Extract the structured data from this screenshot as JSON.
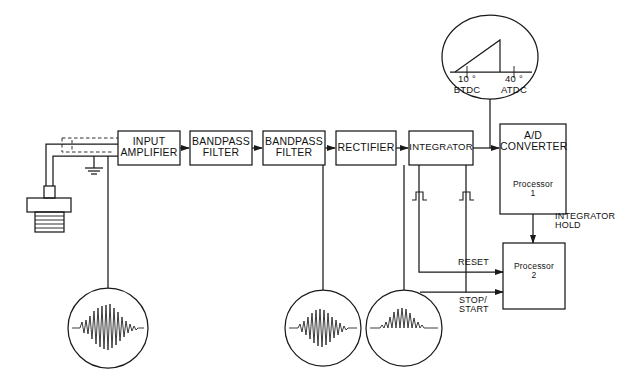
{
  "diagram": {
    "line_color": "#1a1a1a",
    "background": "#ffffff"
  },
  "blocks": [
    {
      "id": "input-amplifier",
      "label": "INPUT\nAMPLIFIER",
      "x": 118,
      "y": 131,
      "w": 62,
      "h": 34
    },
    {
      "id": "bandpass-filter-1",
      "label": "BANDPASS\nFILTER",
      "x": 190,
      "y": 131,
      "w": 62,
      "h": 34
    },
    {
      "id": "bandpass-filter-2",
      "label": "BANDPASS\nFILTER",
      "x": 263,
      "y": 131,
      "w": 62,
      "h": 34
    },
    {
      "id": "rectifier",
      "label": "RECTIFIER",
      "x": 336,
      "y": 131,
      "w": 60,
      "h": 34
    },
    {
      "id": "integrator",
      "label": "INTEGRATOR",
      "x": 409,
      "y": 131,
      "w": 64,
      "h": 34
    }
  ],
  "ad_converter": {
    "id": "ad-converter",
    "label": "A/D\nCONVERTER",
    "processor_label": "Processor\n1",
    "x": 500,
    "y": 124,
    "w": 66,
    "h": 90
  },
  "processor_2": {
    "id": "processor-2",
    "label": "Processor\n2",
    "x": 503,
    "y": 243,
    "w": 62,
    "h": 66
  },
  "signal_labels": [
    {
      "id": "integrator-hold",
      "text": "INTEGRATOR\nHOLD",
      "x": 560,
      "y": 212
    },
    {
      "id": "reset",
      "text": "RESET",
      "x": 478,
      "y": 262
    },
    {
      "id": "stop-start",
      "text": "STOP/\nSTART",
      "x": 479,
      "y": 299
    }
  ],
  "timing_inset": {
    "id": "timing-window",
    "left_angle": "10 °",
    "left_ref": "BTDC",
    "right_angle": "40 °",
    "right_ref": "ATDC",
    "cx": 490,
    "cy": 57,
    "rx": 48,
    "ry": 42
  },
  "waveform_circles": [
    {
      "id": "raw-knock-signal",
      "cx": 108,
      "cy": 328,
      "r": 40
    },
    {
      "id": "filtered-knock-signal",
      "cx": 323,
      "cy": 328,
      "r": 38
    },
    {
      "id": "rectified-knock-signal",
      "cx": 404,
      "cy": 328,
      "r": 38
    }
  ],
  "pulse_markers": [
    {
      "id": "reset-pulse",
      "x": 419,
      "y": 196
    },
    {
      "id": "hold-pulse",
      "x": 466,
      "y": 196
    }
  ],
  "sensor": {
    "id": "knock-sensor",
    "x": 27,
    "y": 186,
    "w": 44,
    "h": 42
  },
  "ground": {
    "id": "ground-symbol",
    "x": 94,
    "y": 158
  }
}
